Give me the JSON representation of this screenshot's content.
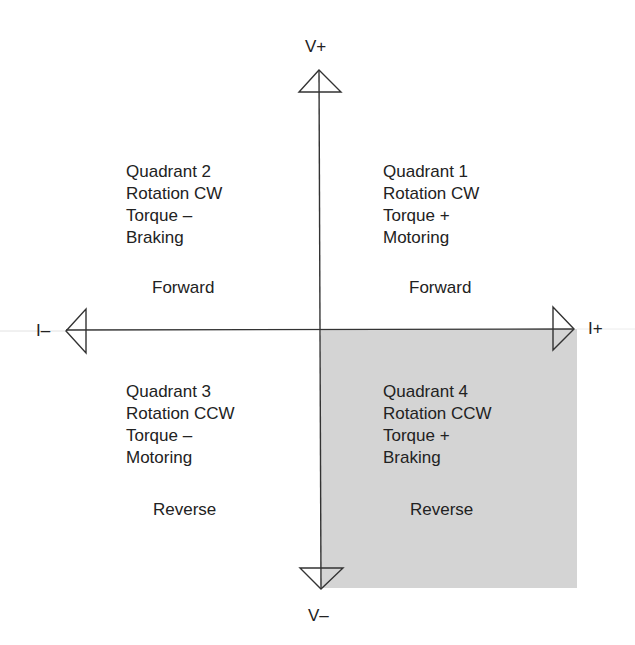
{
  "diagram": {
    "type": "four-quadrant motor operation diagram",
    "colors": {
      "axis": "#333333",
      "shaded_quadrant": "#d4d4d4",
      "text": "#222222"
    },
    "axes": {
      "v_plus": "V+",
      "v_minus": "V–",
      "i_plus": "I+",
      "i_minus": "I–"
    },
    "quadrants": [
      {
        "title": "Quadrant 1",
        "rotation": "Rotation CW",
        "torque": "Torque +",
        "mode": "Motoring",
        "direction": "Forward",
        "shaded": false
      },
      {
        "title": "Quadrant 2",
        "rotation": "Rotation CW",
        "torque": "Torque –",
        "mode": "Braking",
        "direction": "Forward",
        "shaded": false
      },
      {
        "title": "Quadrant 3",
        "rotation": "Rotation CCW",
        "torque": "Torque –",
        "mode": "Motoring",
        "direction": "Reverse",
        "shaded": false
      },
      {
        "title": "Quadrant 4",
        "rotation": "Rotation CCW",
        "torque": "Torque +",
        "mode": "Braking",
        "direction": "Reverse",
        "shaded": true
      }
    ]
  }
}
